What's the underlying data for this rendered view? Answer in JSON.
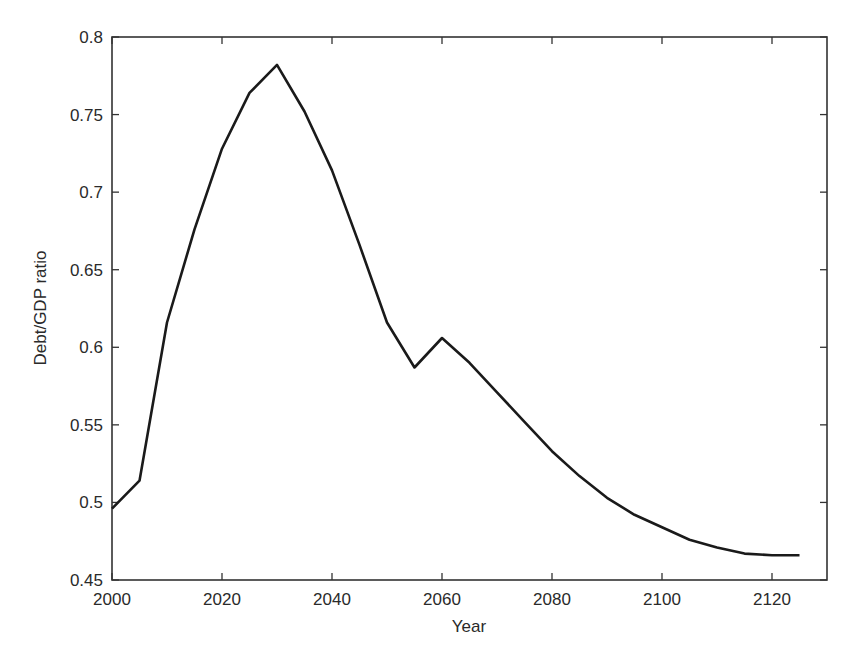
{
  "chart_data": {
    "type": "line",
    "title": "",
    "xlabel": "Year",
    "ylabel": "Debt/GDP ratio",
    "xlim": [
      2000,
      2130
    ],
    "ylim": [
      0.45,
      0.8
    ],
    "grid": false,
    "legend": null,
    "x_ticks": [
      2000,
      2020,
      2040,
      2060,
      2080,
      2100,
      2120
    ],
    "x_tick_labels": [
      "2000",
      "2020",
      "2040",
      "2060",
      "2080",
      "2100",
      "2120"
    ],
    "y_ticks": [
      0.45,
      0.5,
      0.55,
      0.6,
      0.65,
      0.7,
      0.75,
      0.8
    ],
    "y_tick_labels": [
      "0.45",
      "0.5",
      "0.55",
      "0.6",
      "0.65",
      "0.7",
      "0.75",
      "0.8"
    ],
    "series": [
      {
        "name": "Debt/GDP ratio",
        "color": "#1a1a1a",
        "x": [
          2000,
          2005,
          2010,
          2015,
          2020,
          2025,
          2030,
          2035,
          2040,
          2045,
          2050,
          2055,
          2060,
          2065,
          2070,
          2075,
          2080,
          2085,
          2090,
          2095,
          2100,
          2105,
          2110,
          2115,
          2120,
          2125
        ],
        "y": [
          0.496,
          0.514,
          0.616,
          0.676,
          0.728,
          0.764,
          0.782,
          0.752,
          0.714,
          0.666,
          0.616,
          0.587,
          0.606,
          0.59,
          0.571,
          0.552,
          0.533,
          0.517,
          0.503,
          0.492,
          0.484,
          0.476,
          0.471,
          0.467,
          0.466,
          0.466
        ]
      }
    ]
  }
}
